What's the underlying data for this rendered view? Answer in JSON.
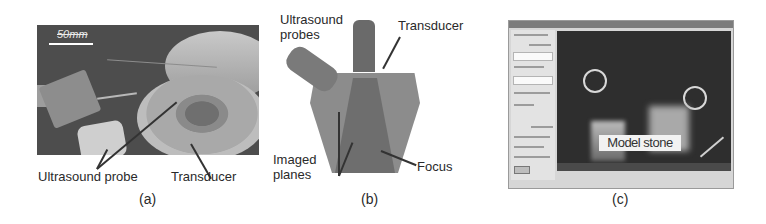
{
  "figure": {
    "panels": [
      {
        "id": "a",
        "caption": "(a)",
        "scale_bar": "50mm",
        "labels": [
          "Ultrasound probe",
          "Transducer"
        ]
      },
      {
        "id": "b",
        "caption": "(b)",
        "labels": {
          "probes": "Ultrasound probes",
          "transducer": "Transducer",
          "planes": "Imaged planes",
          "focus": "Focus"
        }
      },
      {
        "id": "c",
        "caption": "(c)",
        "overlay_label": "Model stone"
      }
    ]
  }
}
